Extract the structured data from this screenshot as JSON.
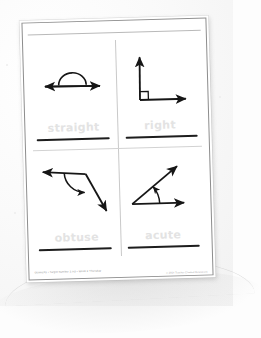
{
  "document": {
    "type": "geometry-worksheet",
    "title_visible": false,
    "orientation": "portrait",
    "rotation_degrees": -1.6,
    "paper_color": "#ffffff",
    "background_color": "#f7f7f7",
    "ink_color": "#1d1d1d",
    "trace_text_color": "#e3e3e3",
    "grid_line_color": "#c9c9c9",
    "frame_color": "#8d8d8d"
  },
  "footer": {
    "left_text": "Geometry • Target Number 2.6G • Week 2 Thursday",
    "right_text": "© 2014 Teacher Created Resources"
  },
  "quadrants": [
    {
      "id": "straight",
      "position": "top-left",
      "label": "straight",
      "angle_degrees": 180,
      "figure_name": "straight-angle-diagram",
      "description": "A horizontal double-headed arrow through a vertex with a semicircular arc drawn above it marking a 180 degree angle."
    },
    {
      "id": "right",
      "position": "top-right",
      "label": "right",
      "angle_degrees": 90,
      "figure_name": "right-angle-diagram",
      "description": "A vertical ray pointing up and a horizontal ray pointing right meeting at a vertex, with a small square box marking the 90 degree corner."
    },
    {
      "id": "obtuse",
      "position": "bottom-left",
      "label": "obtuse",
      "angle_degrees": 135,
      "figure_name": "obtuse-angle-diagram",
      "description": "A horizontal ray pointing left and a ray angling down to the right meeting at a vertex, with a curved arrow arc marking the obtuse angle."
    },
    {
      "id": "acute",
      "position": "bottom-right",
      "label": "acute",
      "angle_degrees": 45,
      "figure_name": "acute-angle-diagram",
      "description": "A horizontal ray pointing right and a ray angling up to the right meeting at a vertex, with a small arc marking the acute angle."
    }
  ]
}
